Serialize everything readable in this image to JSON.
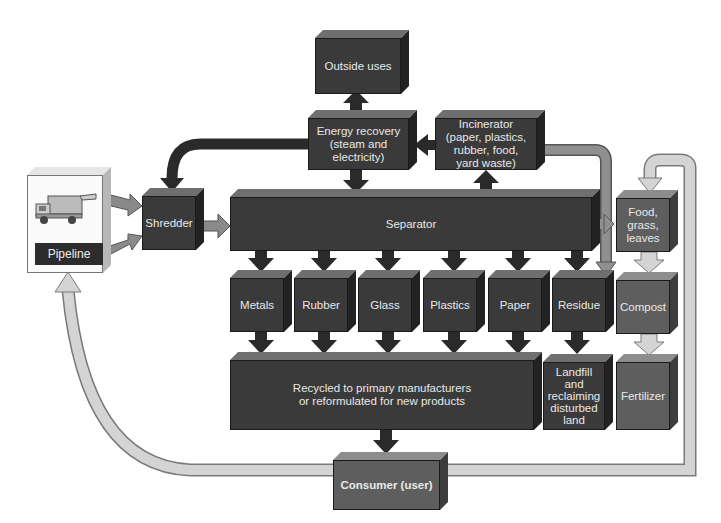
{
  "diagram": {
    "nodes": {
      "outside_uses": "Outside uses",
      "energy_recovery": "Energy recovery (steam and electricity)",
      "energy_recovery_lines": [
        "Energy recovery",
        "(steam and",
        "electricity)"
      ],
      "incinerator_lines": [
        "Incinerator",
        "(paper, plastics,",
        "rubber, food,",
        "yard waste)"
      ],
      "pipeline": "Pipeline",
      "shredder": "Shredder",
      "separator": "Separator",
      "metals": "Metals",
      "rubber": "Rubber",
      "glass": "Glass",
      "plastics": "Plastics",
      "paper": "Paper",
      "residue": "Residue",
      "food_lines": [
        "Food,",
        "grass,",
        "leaves"
      ],
      "compost": "Compost",
      "fertilizer": "Fertilizer",
      "recycled_lines": [
        "Recycled to primary manufacturers",
        "or reformulated for new products"
      ],
      "landfill_lines": [
        "Landfill",
        "and",
        "reclaiming",
        "disturbed",
        "land"
      ],
      "consumer": "Consumer (user)"
    },
    "icons": {
      "pipeline_image": "garbage-truck-icon"
    },
    "colors": {
      "dark": "#3a3a3a",
      "mid": "#5e5e5e",
      "light_arrow": "#cfcfcf",
      "mid_arrow": "#8a8a8a",
      "dark_arrow": "#2a2a2a"
    }
  }
}
